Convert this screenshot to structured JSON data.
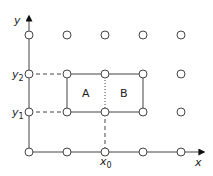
{
  "diagram": {
    "axes": {
      "x_label": "x",
      "y_label": "y"
    },
    "tick_labels": {
      "x0": {
        "main": "x",
        "sub": "0"
      },
      "y1": {
        "main": "y",
        "sub": "1"
      },
      "y2": {
        "main": "y",
        "sub": "2"
      }
    },
    "regions": [
      {
        "label": "A"
      },
      {
        "label": "B"
      }
    ],
    "grid": {
      "columns": 5,
      "rows": 4,
      "node_shape": "open-circle"
    },
    "colors": {
      "stroke": "#444444",
      "text": "#222222",
      "background": "#ffffff"
    }
  }
}
